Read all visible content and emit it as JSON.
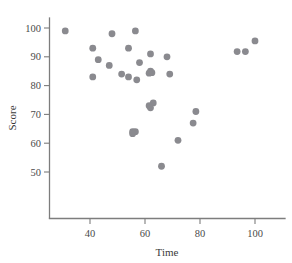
{
  "chart_data": {
    "type": "scatter",
    "title": "",
    "xlabel": "Time",
    "ylabel": "Score",
    "xlim": [
      24,
      110
    ],
    "ylim": [
      46,
      103
    ],
    "xticks": [
      40,
      60,
      80,
      100
    ],
    "xtick_labels": [
      "40",
      "60",
      "80",
      "100"
    ],
    "yticks": [
      50,
      60,
      70,
      80,
      90,
      100
    ],
    "ytick_labels": [
      "50",
      "60",
      "70",
      "80",
      "90",
      "100"
    ],
    "grid": false,
    "legend": null,
    "marker": {
      "shape": "circle",
      "color": "#8a8a8f",
      "size": 3.4
    },
    "series": [
      {
        "name": "observations",
        "points": [
          {
            "x": 31,
            "y": 99
          },
          {
            "x": 48,
            "y": 98
          },
          {
            "x": 56.5,
            "y": 99
          },
          {
            "x": 100,
            "y": 95.5
          },
          {
            "x": 41,
            "y": 93
          },
          {
            "x": 54,
            "y": 93
          },
          {
            "x": 93.5,
            "y": 91.8
          },
          {
            "x": 96.5,
            "y": 91.8
          },
          {
            "x": 62,
            "y": 91
          },
          {
            "x": 68,
            "y": 90
          },
          {
            "x": 43,
            "y": 89
          },
          {
            "x": 58,
            "y": 88
          },
          {
            "x": 47,
            "y": 87
          },
          {
            "x": 62,
            "y": 85
          },
          {
            "x": 62.5,
            "y": 84.5
          },
          {
            "x": 61.5,
            "y": 84.3
          },
          {
            "x": 51.5,
            "y": 84
          },
          {
            "x": 69,
            "y": 84
          },
          {
            "x": 41,
            "y": 83
          },
          {
            "x": 54,
            "y": 83
          },
          {
            "x": 57,
            "y": 82
          },
          {
            "x": 63,
            "y": 74
          },
          {
            "x": 61.5,
            "y": 73
          },
          {
            "x": 62,
            "y": 72.3
          },
          {
            "x": 78.5,
            "y": 71
          },
          {
            "x": 77.5,
            "y": 67
          },
          {
            "x": 55.5,
            "y": 64
          },
          {
            "x": 56.5,
            "y": 64
          },
          {
            "x": 55.5,
            "y": 63.3
          },
          {
            "x": 72,
            "y": 61
          },
          {
            "x": 66,
            "y": 52
          }
        ]
      }
    ]
  }
}
